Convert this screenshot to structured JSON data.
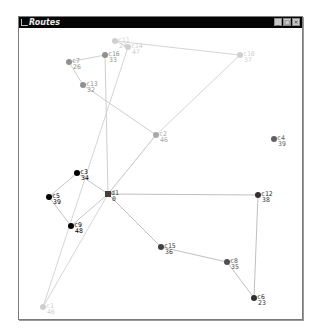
{
  "window": {
    "title": "Routes",
    "buttons": {
      "minimize": "_",
      "maximize": "□",
      "close": "×"
    }
  },
  "colors": {
    "route_light": "#c8c8c8",
    "route_gray": "#a0a0a0",
    "route_dark": "#505050",
    "route_black": "#000000",
    "depot": "#404040",
    "edge": "#c8c8c8"
  },
  "nodes": [
    {
      "id": "d1",
      "demand": "0",
      "x": 107,
      "y": 193,
      "type": "depot",
      "color": "#404040"
    },
    {
      "id": "c1",
      "demand": "46",
      "x": 42,
      "y": 306,
      "color": "#d0d0d0"
    },
    {
      "id": "c2",
      "demand": "46",
      "x": 155,
      "y": 134,
      "color": "#a8a8a8"
    },
    {
      "id": "c3",
      "demand": "34",
      "x": 76,
      "y": 172,
      "color": "#000000"
    },
    {
      "id": "c4",
      "demand": "39",
      "x": 273,
      "y": 138,
      "color": "#606060"
    },
    {
      "id": "c5",
      "demand": "39",
      "x": 48,
      "y": 196,
      "color": "#000000"
    },
    {
      "id": "c6",
      "demand": "23",
      "x": 253,
      "y": 297,
      "color": "#303030"
    },
    {
      "id": "c7",
      "demand": "26",
      "x": 68,
      "y": 61,
      "color": "#909090"
    },
    {
      "id": "c8",
      "demand": "35",
      "x": 226,
      "y": 261,
      "color": "#505050"
    },
    {
      "id": "c9",
      "demand": "48",
      "x": 70,
      "y": 225,
      "color": "#000000"
    },
    {
      "id": "c10",
      "demand": "37",
      "x": 239,
      "y": 54,
      "color": "#d0d0d0"
    },
    {
      "id": "c11",
      "demand": "24",
      "x": 114,
      "y": 40,
      "color": "#d0d0d0"
    },
    {
      "id": "c12",
      "demand": "38",
      "x": 257,
      "y": 194,
      "color": "#303030"
    },
    {
      "id": "c13",
      "demand": "32",
      "x": 82,
      "y": 84,
      "color": "#909090"
    },
    {
      "id": "c14",
      "demand": "47",
      "x": 127,
      "y": 46,
      "color": "#d0d0d0"
    },
    {
      "id": "c15",
      "demand": "36",
      "x": 160,
      "y": 246,
      "color": "#404040"
    },
    {
      "id": "c16",
      "demand": "33",
      "x": 104,
      "y": 54,
      "color": "#909090"
    }
  ],
  "routes": [
    {
      "name": "route-1",
      "color": "#000000",
      "stroke": "#c0c0c0",
      "path": [
        "d1",
        "c3",
        "c5",
        "c9",
        "d1"
      ]
    },
    {
      "name": "route-2",
      "color": "#a8a8a8",
      "stroke": "#c8c8c8",
      "path": [
        "d1",
        "c2",
        "c13",
        "c7",
        "c16",
        "d1"
      ]
    },
    {
      "name": "route-3",
      "color": "#d0d0d0",
      "stroke": "#d0d0d0",
      "path": [
        "d1",
        "c2",
        "c10",
        "c11",
        "c14",
        "c1",
        "d1"
      ]
    },
    {
      "name": "route-4",
      "color": "#404040",
      "stroke": "#b8b8b8",
      "path": [
        "d1",
        "c12",
        "c6",
        "c8",
        "c15",
        "d1"
      ]
    }
  ]
}
